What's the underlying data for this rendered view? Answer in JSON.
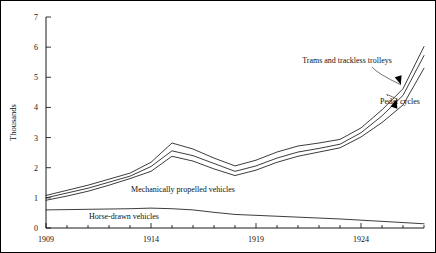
{
  "chart_data": {
    "type": "line",
    "title": "",
    "xlabel": "",
    "ylabel": "Thousands",
    "xlim": [
      1909,
      1927
    ],
    "ylim": [
      0,
      7
    ],
    "yticks": [
      0,
      1,
      2,
      3,
      4,
      5,
      6,
      7
    ],
    "ytick_labels": [
      "0",
      "1",
      "2",
      "3",
      "4",
      "5",
      "6",
      "7"
    ],
    "xticks": [
      1909,
      1910,
      1911,
      1912,
      1913,
      1914,
      1915,
      1916,
      1917,
      1918,
      1919,
      1920,
      1921,
      1922,
      1923,
      1924,
      1925,
      1926,
      1927
    ],
    "xtick_labels": [
      "1909",
      "",
      "",
      "",
      "",
      "1914",
      "",
      "",
      "",
      "",
      "1919",
      "",
      "",
      "",
      "",
      "1924",
      "",
      "",
      ""
    ],
    "grid": false,
    "legend_position": "inline-annotations",
    "x": [
      1909,
      1910,
      1911,
      1912,
      1913,
      1914,
      1915,
      1916,
      1917,
      1918,
      1919,
      1920,
      1921,
      1922,
      1923,
      1924,
      1925,
      1926,
      1927
    ],
    "series": [
      {
        "name": "Trams and trackless trolleys",
        "values": [
          1.08,
          1.25,
          1.42,
          1.62,
          1.82,
          2.18,
          2.82,
          2.62,
          2.32,
          2.06,
          2.25,
          2.52,
          2.72,
          2.82,
          2.94,
          3.32,
          3.92,
          4.62,
          6.02
        ]
      },
      {
        "name": "Pedal cycles",
        "values": [
          1.0,
          1.16,
          1.32,
          1.52,
          1.72,
          2.04,
          2.56,
          2.4,
          2.14,
          1.88,
          2.06,
          2.32,
          2.52,
          2.64,
          2.78,
          3.16,
          3.72,
          4.4,
          5.72
        ]
      },
      {
        "name": "Mechanically propelled vehicles",
        "values": [
          0.92,
          1.06,
          1.22,
          1.42,
          1.64,
          1.88,
          2.38,
          2.22,
          1.96,
          1.74,
          1.92,
          2.18,
          2.38,
          2.52,
          2.66,
          3.02,
          3.5,
          4.08,
          5.3
        ]
      },
      {
        "name": "Horse-drawn vehicles",
        "values": [
          0.6,
          0.61,
          0.62,
          0.63,
          0.64,
          0.66,
          0.64,
          0.6,
          0.52,
          0.45,
          0.42,
          0.39,
          0.36,
          0.33,
          0.3,
          0.26,
          0.22,
          0.18,
          0.14
        ]
      }
    ],
    "annotations": [
      {
        "text": "Trams and trackless trolleys",
        "target_x": 1925.9,
        "target_y": 4.75
      },
      {
        "text": "Pedal cycles",
        "target_x": 1925.7,
        "target_y": 4.28
      },
      {
        "text": "Mechanically propelled vehicles",
        "target_x": 1916.5,
        "target_y": 1.05
      },
      {
        "text": "Horse-drawn vehicles",
        "target_x": 1913.0,
        "target_y": 0.33
      }
    ]
  }
}
